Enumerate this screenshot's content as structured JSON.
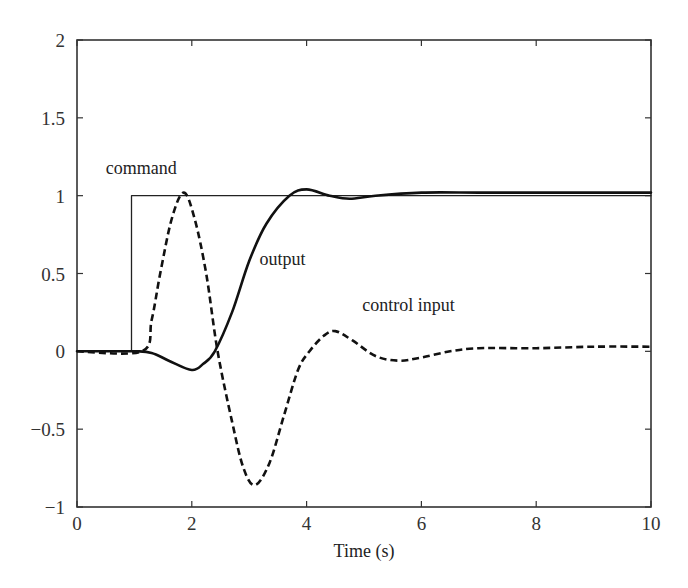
{
  "chart_data": {
    "type": "line",
    "title": "",
    "xlabel": "Time (s)",
    "ylabel": "",
    "xlim": [
      0,
      10
    ],
    "ylim": [
      -1,
      2
    ],
    "grid": false,
    "legend": "none (inline annotations)",
    "x_ticks": [
      0,
      2,
      4,
      6,
      8,
      10
    ],
    "x_tick_labels": [
      "0",
      "2",
      "4",
      "6",
      "8",
      "10"
    ],
    "y_ticks": [
      -1,
      -0.5,
      0,
      0.5,
      1,
      1.5,
      2
    ],
    "y_tick_labels": [
      "−1",
      "−0.5",
      "0",
      "0.5",
      "1",
      "1.5",
      "2"
    ],
    "series": [
      {
        "name": "command",
        "style": "thin solid",
        "color": "#222222",
        "x": [
          0,
          0.95,
          0.95,
          10
        ],
        "y": [
          0,
          0,
          1,
          1
        ]
      },
      {
        "name": "output",
        "style": "thick solid",
        "color": "#111111",
        "x": [
          0,
          1.0,
          1.3,
          1.6,
          2.0,
          2.2,
          2.4,
          2.7,
          3.0,
          3.3,
          3.7,
          4.0,
          4.4,
          4.75,
          5.2,
          6.0,
          7.0,
          8.0,
          9.0,
          10.0
        ],
        "y": [
          0,
          0,
          -0.01,
          -0.06,
          -0.12,
          -0.08,
          0.0,
          0.25,
          0.58,
          0.82,
          1.0,
          1.04,
          1.0,
          0.98,
          1.0,
          1.02,
          1.02,
          1.02,
          1.02,
          1.02
        ]
      },
      {
        "name": "control input",
        "style": "thick dashed",
        "color": "#111111",
        "x": [
          0,
          1.13,
          1.3,
          1.45,
          1.65,
          1.86,
          2.05,
          2.25,
          2.45,
          2.7,
          2.9,
          3.1,
          3.35,
          3.6,
          3.85,
          4.05,
          4.3,
          4.5,
          4.8,
          5.2,
          5.6,
          6.0,
          6.5,
          7.0,
          8.0,
          9.0,
          10.0
        ],
        "y": [
          0,
          0,
          0.2,
          0.5,
          0.85,
          1.02,
          0.85,
          0.5,
          0.0,
          -0.45,
          -0.75,
          -0.86,
          -0.72,
          -0.42,
          -0.12,
          0.0,
          0.1,
          0.13,
          0.07,
          -0.03,
          -0.06,
          -0.04,
          0.0,
          0.02,
          0.02,
          0.03,
          0.03
        ]
      }
    ],
    "annotations": [
      {
        "text": "command",
        "x": 0.5,
        "y": 1.18
      },
      {
        "text": "output",
        "x": 3.18,
        "y": 0.59
      },
      {
        "text": "control input",
        "x": 4.97,
        "y": 0.3
      }
    ]
  }
}
